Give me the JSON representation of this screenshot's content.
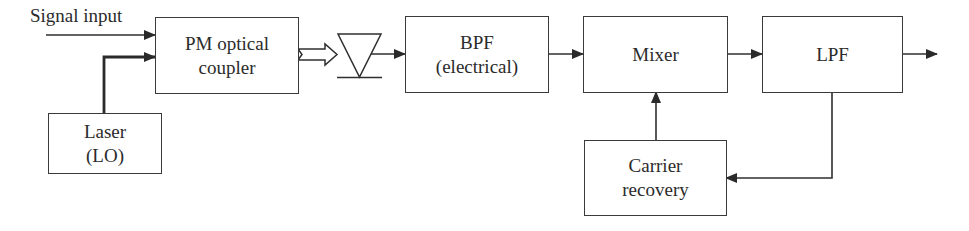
{
  "diagram": {
    "type": "block-diagram",
    "colors": {
      "stroke": "#333333",
      "text": "#2b2b2b",
      "background": "#ffffff"
    },
    "input_label": "Signal input",
    "blocks": {
      "coupler": {
        "line1": "PM optical",
        "line2": "coupler"
      },
      "laser": {
        "line1": "Laser",
        "line2": "(LO)"
      },
      "photodiode": {
        "symbol": "photodiode-icon"
      },
      "bpf": {
        "line1": "BPF",
        "line2": "(electrical)"
      },
      "mixer": {
        "line1": "Mixer"
      },
      "lpf": {
        "line1": "LPF"
      },
      "carrier_recovery": {
        "line1": "Carrier",
        "line2": "recovery"
      }
    },
    "connections": [
      {
        "from": "Signal input",
        "to": "PM optical coupler",
        "style": "arrow"
      },
      {
        "from": "Laser (LO)",
        "to": "PM optical coupler",
        "style": "thick-arrow"
      },
      {
        "from": "PM optical coupler",
        "to": "Photodiode",
        "style": "hollow-optical-arrow"
      },
      {
        "from": "Photodiode",
        "to": "BPF (electrical)",
        "style": "arrow"
      },
      {
        "from": "BPF (electrical)",
        "to": "Mixer",
        "style": "arrow"
      },
      {
        "from": "Mixer",
        "to": "LPF",
        "style": "arrow"
      },
      {
        "from": "LPF",
        "to": "Output",
        "style": "arrow"
      },
      {
        "from": "LPF",
        "to": "Carrier recovery",
        "style": "feedback-arrow"
      },
      {
        "from": "Carrier recovery",
        "to": "Mixer",
        "style": "arrow"
      }
    ]
  }
}
